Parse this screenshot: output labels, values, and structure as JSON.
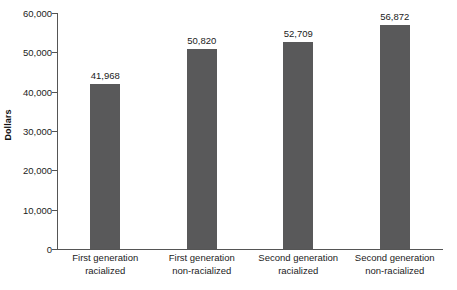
{
  "chart_data": {
    "type": "bar",
    "title": "",
    "subtitle": "",
    "xlabel": "",
    "ylabel": "Dollars",
    "categories": [
      "First generation racialized",
      "First generation non-racialized",
      "Second generation racialized",
      "Second generation non-racialized"
    ],
    "category_lines": [
      [
        "First generation",
        "racialized"
      ],
      [
        "First generation",
        "non-racialized"
      ],
      [
        "Second generation",
        "racialized"
      ],
      [
        "Second generation",
        "non-racialized"
      ]
    ],
    "values": [
      41968,
      50820,
      52709,
      56872
    ],
    "value_labels": [
      "41,968",
      "50,820",
      "52,709",
      "56,872"
    ],
    "ylim": [
      0,
      60000
    ],
    "y_tick_values": [
      0,
      10000,
      20000,
      30000,
      40000,
      50000,
      60000
    ],
    "y_tick_labels": [
      "0",
      "10,000",
      "20,000",
      "30,000",
      "40,000",
      "50,000",
      "60,000"
    ],
    "grid": false,
    "legend": "none",
    "bar_color": "#59595a",
    "axis_color": "#555555",
    "text_color": "#1b1b1b",
    "background_color": "#ffffff"
  }
}
